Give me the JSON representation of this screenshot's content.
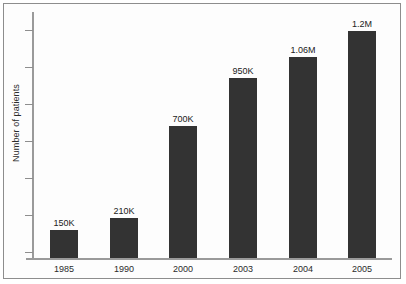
{
  "chart_data": {
    "type": "bar",
    "title": "",
    "xlabel": "",
    "ylabel": "Number of patients",
    "categories": [
      "1985",
      "1990",
      "2000",
      "2003",
      "2004",
      "2005"
    ],
    "values": [
      150000,
      210000,
      700000,
      950000,
      1060000,
      1200000
    ],
    "value_labels": [
      "150K",
      "210K",
      "700K",
      "950K",
      "1.06M",
      "1.2M"
    ],
    "ylim": [
      0,
      1300000
    ],
    "y_tick_count": 7,
    "y_tick_labels": [],
    "grid": false,
    "legend": false,
    "bar_color": "#333333",
    "axis_color": "#9a9a9a",
    "background_color": "#fdfdfd",
    "frame_color": "#8d8d8d"
  }
}
